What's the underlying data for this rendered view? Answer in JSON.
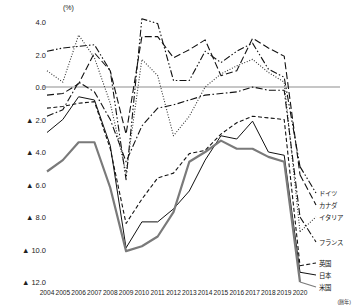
{
  "chart": {
    "unit_label": "(%)",
    "source_note": "(暦年)",
    "axis": {
      "y_ticks": [
        "4.0",
        "2.0",
        "0.0",
        "▲ 2.0",
        "▲ 4.0",
        "▲ 6.0",
        "▲ 8.0",
        "▲ 10.0",
        "▲ 12.0"
      ],
      "y_values": [
        4.0,
        2.0,
        0.0,
        -2.0,
        -4.0,
        -6.0,
        -8.0,
        -10.0,
        -12.0
      ]
    }
  },
  "legend": [
    {
      "label": "ドイツ",
      "top": 189
    },
    {
      "label": "カナダ",
      "top": 201
    },
    {
      "label": "イタリア",
      "top": 213
    },
    {
      "label": "フランス",
      "top": 238
    },
    {
      "label": "英国",
      "top": 259
    },
    {
      "label": "日本",
      "top": 271
    },
    {
      "label": "米国",
      "top": 283
    }
  ],
  "chart_data": {
    "type": "line",
    "title": "",
    "xlabel": "(暦年)",
    "ylabel": "(%)",
    "ylim": [
      -12.0,
      4.0
    ],
    "grid": false,
    "zero_line": true,
    "legend_position": "right",
    "categories": [
      "2004",
      "2005",
      "2006",
      "2007",
      "2008",
      "2009",
      "2010",
      "2011",
      "2012",
      "2013",
      "2014",
      "2015",
      "2016",
      "2017",
      "2018",
      "2019",
      "2020"
    ],
    "series": [
      {
        "name": "ドイツ",
        "style": "dash-dot-dot",
        "color": "#111111",
        "width": 1.1,
        "values": [
          2.2,
          2.4,
          2.5,
          2.6,
          1.0,
          -5.7,
          4.2,
          3.9,
          0.4,
          0.4,
          2.2,
          1.5,
          2.2,
          2.7,
          1.1,
          0.6,
          -4.9
        ]
      },
      {
        "name": "カナダ",
        "style": "dash-long",
        "color": "#111111",
        "width": 1.1,
        "values": [
          -0.5,
          -0.4,
          0.2,
          2.1,
          1.0,
          -2.9,
          3.1,
          3.1,
          1.8,
          2.3,
          2.9,
          0.7,
          1.0,
          3.0,
          2.4,
          1.9,
          -5.4
        ]
      },
      {
        "name": "イタリア",
        "style": "dotted",
        "color": "#333333",
        "width": 1.1,
        "values": [
          1.0,
          0.3,
          3.2,
          1.8,
          -1.0,
          -5.3,
          1.7,
          0.7,
          -3.0,
          -1.8,
          0.0,
          0.8,
          1.3,
          1.7,
          0.9,
          0.3,
          -8.9
        ]
      },
      {
        "name": "フランス",
        "style": "dash-dot",
        "color": "#111111",
        "width": 1.1,
        "values": [
          -1.8,
          -1.4,
          0.3,
          -0.3,
          -2.0,
          -4.6,
          -2.4,
          -1.3,
          -1.1,
          -0.8,
          -0.5,
          -0.4,
          -0.3,
          0.0,
          -0.2,
          -0.2,
          -8.0
        ]
      },
      {
        "name": "英国",
        "style": "dashed",
        "color": "#111111",
        "width": 1.1,
        "values": [
          -1.3,
          -1.2,
          -1.0,
          -0.9,
          -3.8,
          -8.4,
          -6.9,
          -5.6,
          -5.3,
          -4.1,
          -3.9,
          -2.9,
          -2.2,
          -1.8,
          -1.9,
          -2.0,
          -11.0
        ]
      },
      {
        "name": "日本",
        "style": "solid",
        "color": "#111111",
        "width": 1.0,
        "values": [
          -2.8,
          -2.0,
          -0.6,
          -0.8,
          -3.6,
          -9.9,
          -8.3,
          -8.3,
          -7.5,
          -6.4,
          -4.5,
          -3.0,
          -3.2,
          -2.1,
          -4.0,
          -4.2,
          -11.4
        ]
      },
      {
        "name": "米国",
        "style": "solid-thick",
        "color": "#7a7a7a",
        "width": 2.2,
        "values": [
          -5.2,
          -4.5,
          -3.4,
          -3.4,
          -6.2,
          -10.1,
          -9.8,
          -9.2,
          -7.7,
          -4.6,
          -4.0,
          -3.3,
          -3.8,
          -3.8,
          -4.3,
          -4.6,
          -12.0
        ]
      }
    ]
  }
}
